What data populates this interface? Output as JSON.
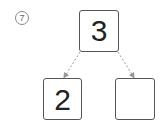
{
  "problem": {
    "number_label": "7",
    "top_value": "3",
    "bottom_left_value": "2",
    "bottom_right_value": ""
  },
  "colors": {
    "box_border": "#555555",
    "arrow": "#999999",
    "text": "#222222"
  }
}
